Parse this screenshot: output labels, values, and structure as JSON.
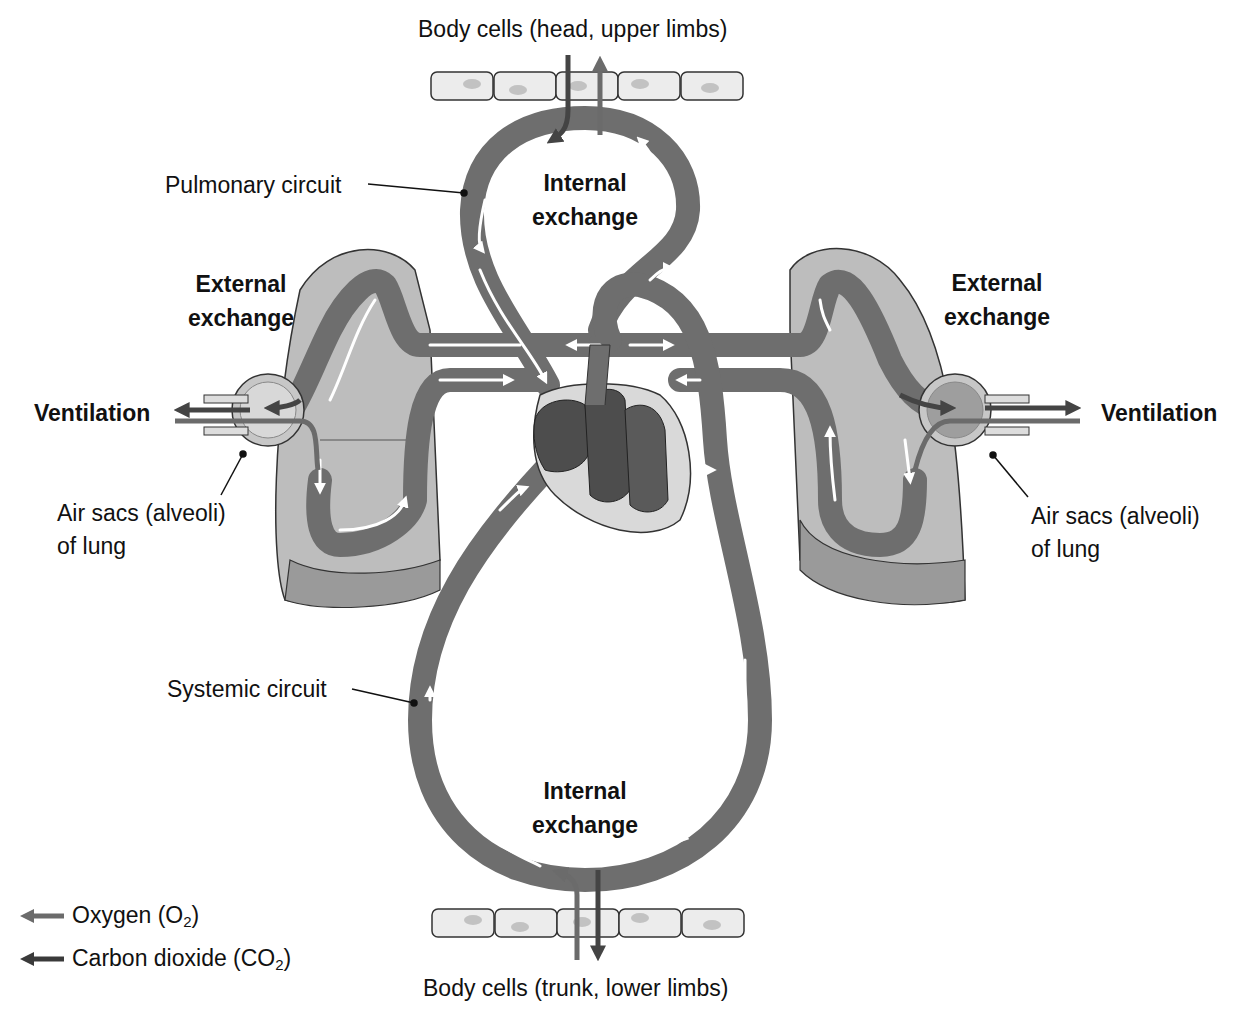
{
  "labels": {
    "body_cells_top": "Body cells (head, upper limbs)",
    "body_cells_bottom": "Body cells (trunk, lower limbs)",
    "pulmonary_circuit": "Pulmonary circuit",
    "systemic_circuit": "Systemic circuit",
    "internal_exchange_top_line1": "Internal",
    "internal_exchange_top_line2": "exchange",
    "internal_exchange_bottom_line1": "Internal",
    "internal_exchange_bottom_line2": "exchange",
    "external_exchange_left_line1": "External",
    "external_exchange_left_line2": "exchange",
    "external_exchange_right_line1": "External",
    "external_exchange_right_line2": "exchange",
    "ventilation_left": "Ventilation",
    "ventilation_right": "Ventilation",
    "air_sacs_left_line1": "Air sacs (alveoli)",
    "air_sacs_left_line2": "of lung",
    "air_sacs_right_line1": "Air sacs (alveoli)",
    "air_sacs_right_line2": "of lung"
  },
  "legend": [
    {
      "label_main": "Oxygen (O",
      "label_sub": "2",
      "label_end": ")",
      "color": "#6b6b6b",
      "icon": "arrow-left-icon"
    },
    {
      "label_main": "Carbon dioxide (CO",
      "label_sub": "2",
      "label_end": ")",
      "color": "#3a3a3a",
      "icon": "arrow-left-icon"
    }
  ],
  "colors": {
    "vessel": "#6e6e6e",
    "vessel_dark": "#4a4a4a",
    "lung": "#bdbdbd",
    "lung_dark": "#9a9a9a",
    "heart_outer": "#d9d9d9",
    "heart_chamber": "#4d4d4d",
    "cell_fill": "#ececec",
    "cell_nucleus": "#c2c2c2"
  }
}
